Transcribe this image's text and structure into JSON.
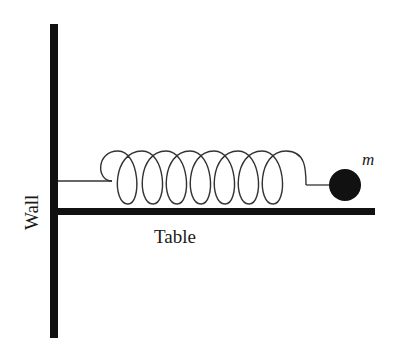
{
  "diagram": {
    "labels": {
      "wall": "Wall",
      "table": "Table",
      "mass": "m"
    },
    "components": [
      {
        "id": "wall",
        "type": "vertical-bar"
      },
      {
        "id": "table",
        "type": "horizontal-bar"
      },
      {
        "id": "spring",
        "type": "coil-spring",
        "coils": 8
      },
      {
        "id": "mass",
        "type": "solid-ball"
      }
    ],
    "colors": {
      "ink": "#111111",
      "background": "#ffffff"
    }
  }
}
